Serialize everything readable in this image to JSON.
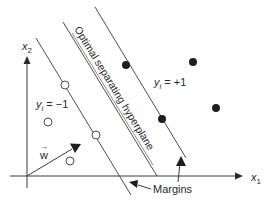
{
  "figure": {
    "title": "Optimal separating hyperplane",
    "axes": {
      "x_label": "x",
      "x_sub": "1",
      "y_label": "x",
      "y_sub": "2"
    },
    "classes": {
      "positive": {
        "label_var": "y",
        "label_sub": "i",
        "label_val": " = +1",
        "marker": "filled-circle"
      },
      "negative": {
        "label_var": "y",
        "label_sub": "i",
        "label_val": " = −1",
        "marker": "open-circle"
      }
    },
    "weight_vector": {
      "label": "w",
      "accent": "→"
    },
    "hyperplane_label": "Optimal separating hyperplane",
    "margins_label": "Margins",
    "points": {
      "negative": [
        [
          65,
          85
        ],
        [
          48,
          122
        ],
        [
          96,
          135
        ],
        [
          70,
          161
        ]
      ],
      "positive": [
        [
          126,
          65
        ],
        [
          193,
          62
        ],
        [
          162,
          119
        ],
        [
          216,
          108
        ]
      ]
    },
    "colors": {
      "ink": "#2a2a2a",
      "line": "#3a3a3a",
      "background": "#ffffff"
    }
  }
}
